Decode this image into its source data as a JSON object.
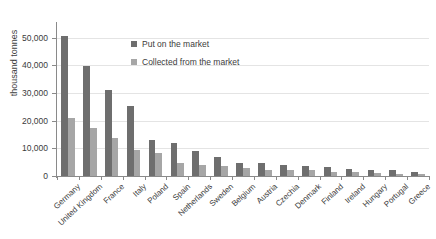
{
  "chart_data": {
    "type": "bar",
    "title": "",
    "subtitle": "",
    "xlabel": "",
    "ylabel": "thousand tonnes",
    "ylim": [
      0,
      55000
    ],
    "ytick_values": [
      0,
      10000,
      20000,
      30000,
      40000,
      50000
    ],
    "ytick_labels": [
      "0",
      "10,000",
      "20,000",
      "30,000",
      "40,000",
      "50,000"
    ],
    "grid": true,
    "legend_position": "inside-top-center",
    "categories": [
      "Germany",
      "United Kingdom",
      "France",
      "Italy",
      "Poland",
      "Spain",
      "Netherlands",
      "Sweden",
      "Belgium",
      "Austria",
      "Czechia",
      "Denmark",
      "Finland",
      "Ireland",
      "Hungary",
      "Portugal",
      "Greece"
    ],
    "series": [
      {
        "name": "Put on the market",
        "color": "#6e6e6e",
        "values": [
          50500,
          39700,
          31300,
          25200,
          13200,
          11800,
          9100,
          6800,
          4700,
          4600,
          4000,
          3500,
          3100,
          2700,
          2100,
          2000,
          1500
        ]
      },
      {
        "name": "Collected from the market",
        "color": "#a6a6a6",
        "values": [
          21100,
          17300,
          13900,
          9500,
          8500,
          4800,
          4100,
          3700,
          2900,
          2300,
          2000,
          2100,
          1400,
          1300,
          1100,
          900,
          600
        ]
      }
    ]
  },
  "colors": {
    "series_put": "#6e6e6e",
    "series_collected": "#a6a6a6",
    "grid": "#e4e4e4",
    "axis": "#8a8a8a",
    "text": "#3b3b3b",
    "background": "#ffffff"
  }
}
